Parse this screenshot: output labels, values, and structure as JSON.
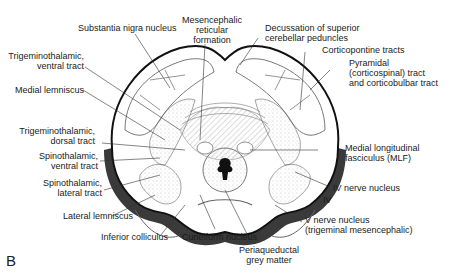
{
  "figure": {
    "panel_letter": "B",
    "labels": {
      "substantia_nigra": "Substantia nigra nucleus",
      "mesencephalic_reticular": [
        "Mesencephalic",
        "reticular",
        "formation"
      ],
      "decussation_scp": [
        "Decussation of superior",
        "cerebellar peduncles"
      ],
      "corticopontine": "Corticopontine tracts",
      "pyramidal": [
        "Pyramidal",
        "(corticospinal) tract",
        "and corticobulbar tract"
      ],
      "trigeminothalamic_ventral": [
        "Trigeminothalamic,",
        "ventral tract"
      ],
      "medial_lemniscus": "Medial lemniscus",
      "trigeminothalamic_dorsal": [
        "Trigeminothalamic,",
        "dorsal tract"
      ],
      "spinothalamic_ventral": [
        "Spinothalamic,",
        "ventral tract"
      ],
      "spinothalamic_lateral": [
        "Spinothalamic,",
        "lateral tract"
      ],
      "lateral_lemniscus": "Lateral lemniscus",
      "inferior_colliculus": "Inferior colliculus",
      "cuneiform_nucleus": "Cuneiform nucleus",
      "periaqueductal": [
        "Periaqueductal",
        "grey matter"
      ],
      "mlf": [
        "Medial longitudinal",
        "fasciculus (MLF)"
      ],
      "iv_nerve_nucleus": "IV nerve nucleus",
      "iv_nerve": "IV",
      "v_nerve_nucleus": [
        "V nerve nucleus",
        "(trigeminal mesencephalic)"
      ]
    },
    "colors": {
      "outline": "#111111",
      "dark_band": "#3a3a3a",
      "stipple": "#9a9a9a",
      "background": "#ffffff"
    }
  }
}
